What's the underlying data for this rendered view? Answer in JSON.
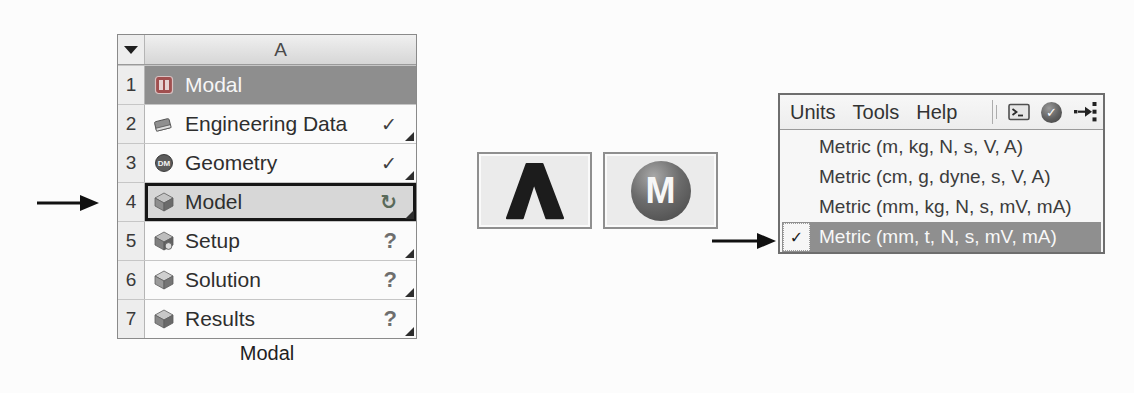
{
  "schematic": {
    "header": {
      "column_label": "A"
    },
    "status_glyphs": {
      "check": "✓",
      "refresh": "↻",
      "question": "?"
    },
    "rows": [
      {
        "num": "1",
        "label": "Modal"
      },
      {
        "num": "2",
        "label": "Engineering Data"
      },
      {
        "num": "3",
        "label": "Geometry",
        "icon_badge": "DM"
      },
      {
        "num": "4",
        "label": "Model"
      },
      {
        "num": "5",
        "label": "Setup"
      },
      {
        "num": "6",
        "label": "Solution"
      },
      {
        "num": "7",
        "label": "Results"
      }
    ],
    "caption": "Modal"
  },
  "launcher": {
    "mechanical_glyph": "M"
  },
  "units_menu": {
    "menubar": {
      "items": [
        "Units",
        "Tools",
        "Help"
      ]
    },
    "check_glyph": "✓",
    "options": [
      {
        "label": "Metric (m, kg, N, s, V, A)",
        "checked": false
      },
      {
        "label": "Metric (cm, g, dyne, s, V, A)",
        "checked": false
      },
      {
        "label": "Metric (mm, kg, N, s, mV, mA)",
        "checked": false
      },
      {
        "label": "Metric (mm, t, N, s, mV, mA)",
        "checked": true
      }
    ]
  },
  "colors": {
    "system_header_bg": "#8e8e8e",
    "selected_cell_bg": "#d7d7d7",
    "selected_cell_border": "#161616",
    "highlighted_option_bg": "#8f8f8f",
    "arrow_color": "#111111"
  }
}
